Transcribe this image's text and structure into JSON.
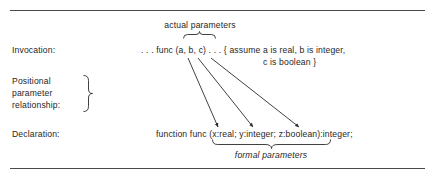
{
  "figure": {
    "background_color": "#ffffff",
    "ink_color": "#262626",
    "rule_color": "#4a4a4a",
    "rules": [
      {
        "name": "top-rule",
        "y": 10
      },
      {
        "name": "bottom-rule",
        "y": 168
      }
    ]
  },
  "captions": {
    "actual_parameters": "actual parameters",
    "formal_parameters": "formal parameters"
  },
  "rows": {
    "invocation": {
      "label": "Invocation:",
      "code": ". . . func (a, b, c) . . . { assume a is real, b is integer,",
      "comment_continuation": "c is boolean }"
    },
    "positional": {
      "line_1": "Positional",
      "line_2": "parameter",
      "line_3": "relationship:"
    },
    "declaration": {
      "label": "Declaration:",
      "keyword": "function",
      "identifier": "func",
      "signature": "(x:real; y:integer; z:boolean):integer;"
    }
  },
  "annotations": {
    "actual_param_brace": {
      "name": "top-brace",
      "x1": 183,
      "x2": 216,
      "y": 38
    },
    "formal_param_brace": {
      "name": "bottom-brace",
      "x1": 212,
      "x2": 331,
      "y": 140
    },
    "positional_brace": {
      "name": "positional-brace",
      "x": 86,
      "y1": 75,
      "y2": 112
    },
    "mapping_arrows": [
      {
        "name": "arrow-a-to-x",
        "from": "a",
        "to": "x",
        "x1": 188,
        "y1": 58,
        "x2": 218,
        "y2": 126
      },
      {
        "name": "arrow-b-to-y",
        "from": "b",
        "to": "y",
        "x1": 198,
        "y1": 58,
        "x2": 253,
        "y2": 126
      },
      {
        "name": "arrow-c-to-z",
        "from": "c",
        "to": "z",
        "x1": 211,
        "y1": 58,
        "x2": 299,
        "y2": 126
      }
    ]
  }
}
